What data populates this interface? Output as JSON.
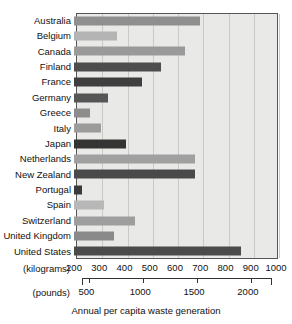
{
  "chart_data": {
    "type": "bar",
    "orientation": "horizontal",
    "title": "",
    "xlabel": "Annual per capita waste generation",
    "ylabel": "",
    "grid": true,
    "legend": null,
    "primary_unit_label": "(kilograms)",
    "secondary_unit_label": "(pounds)",
    "xlim": [
      200,
      1000
    ],
    "xticks": [
      200,
      300,
      400,
      500,
      600,
      700,
      800,
      900,
      1000
    ],
    "secondary_xlim": [
      441,
      2205
    ],
    "secondary_xticks": [
      500,
      1000,
      1500,
      2000
    ],
    "categories": [
      "Australia",
      "Belgium",
      "Canada",
      "Finland",
      "France",
      "Germany",
      "Greece",
      "Italy",
      "Japan",
      "Netherlands",
      "New Zealand",
      "Portugal",
      "Spain",
      "Switzerland",
      "United Kingdom",
      "United States"
    ],
    "values": [
      700,
      370,
      640,
      545,
      470,
      335,
      265,
      305,
      405,
      680,
      680,
      230,
      320,
      440,
      360,
      860
    ],
    "bar_colors": [
      "#8f8f8f",
      "#b4b4b4",
      "#9a9a9a",
      "#4d4d4d",
      "#3f3f3f",
      "#565656",
      "#8d8d8d",
      "#9c9c9c",
      "#343434",
      "#a0a0a0",
      "#4a4a4a",
      "#3a3a3a",
      "#b8b8b8",
      "#9e9e9e",
      "#8a8a8a",
      "#4b4b4b"
    ],
    "plot_background": "#e9e9e7",
    "grid_color": "#c9c9c6",
    "axis_color": "#555555"
  }
}
